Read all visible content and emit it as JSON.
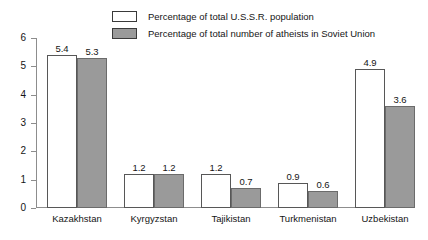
{
  "chart_data": {
    "type": "bar",
    "title": "",
    "xlabel": "",
    "ylabel": "",
    "ylim": [
      0,
      6
    ],
    "yticks": [
      0,
      1,
      2,
      3,
      4,
      5,
      6
    ],
    "grid": false,
    "legend_position": "top",
    "categories": [
      "Kazakhstan",
      "Kyrgyzstan",
      "Tajikistan",
      "Turkmenistan",
      "Uzbekistan"
    ],
    "series": [
      {
        "name": "Percentage of total U.S.S.R. population",
        "color": "#ffffff",
        "values": [
          5.4,
          1.2,
          1.2,
          0.9,
          4.9
        ],
        "labels": [
          "5.4",
          "1.2",
          "1.2",
          "0.9",
          "4.9"
        ]
      },
      {
        "name": "Percentage of total number of atheists in Soviet Union",
        "color": "#9a9a9a",
        "values": [
          5.3,
          1.2,
          0.7,
          0.6,
          3.6
        ],
        "labels": [
          "5.3",
          "1.2",
          "0.7",
          "0.6",
          "3.6"
        ]
      }
    ]
  },
  "legend": {
    "items": [
      {
        "label": "Percentage of total U.S.S.R. population",
        "swatch": "white"
      },
      {
        "label": "Percentage of total number of atheists in Soviet Union",
        "swatch": "gray"
      }
    ]
  },
  "axis": {
    "y_labels": [
      "6",
      "5",
      "4",
      "3",
      "2",
      "1",
      "0"
    ]
  }
}
